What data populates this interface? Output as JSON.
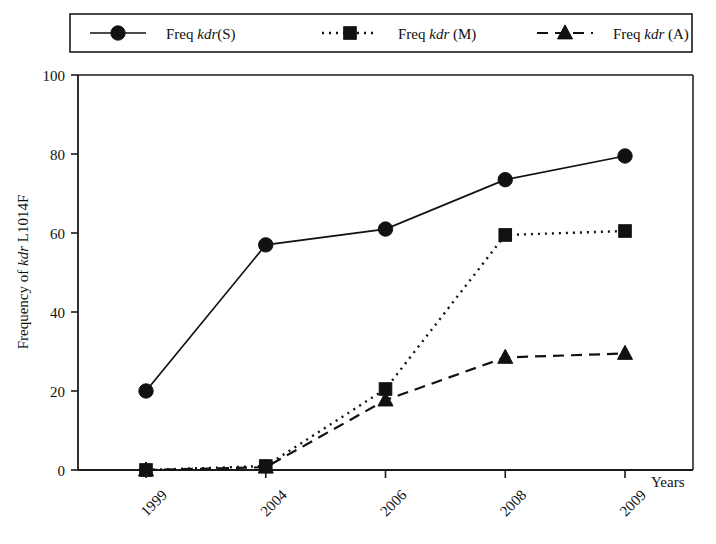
{
  "chart_data": {
    "type": "line",
    "title": "",
    "subtitle": "",
    "xlabel": "Years",
    "ylabel": "Frequency of kdr L1014F",
    "categories": [
      "1999",
      "2004",
      "2006",
      "2008",
      "2009"
    ],
    "x": [
      "1999",
      "2004",
      "2006",
      "2008",
      "2009"
    ],
    "xtick_labels": [
      "1999",
      "2004",
      "2006",
      "2008",
      "2009"
    ],
    "ytick_labels": [
      "0",
      "20",
      "40",
      "60",
      "80",
      "100"
    ],
    "yticks": [
      0,
      20,
      40,
      60,
      80,
      100
    ],
    "ylim": [
      0,
      100
    ],
    "grid": false,
    "legend_position": "top-outside",
    "annotations": [],
    "series": [
      {
        "name": "Freq kdr(S)",
        "name_prefix": "Freq ",
        "name_italic": "kdr",
        "name_suffix": "(S)",
        "marker": "circle",
        "linestyle": "solid",
        "color": "#111111",
        "values": [
          20,
          57,
          61,
          73.5,
          79.5
        ]
      },
      {
        "name": "Freq kdr (M)",
        "name_prefix": "Freq ",
        "name_italic": "kdr",
        "name_suffix": " (M)",
        "marker": "square",
        "linestyle": "dotted",
        "color": "#111111",
        "values": [
          0,
          1,
          20.5,
          59.5,
          60.5
        ]
      },
      {
        "name": "Freq kdr (A)",
        "name_prefix": "Freq ",
        "name_italic": "kdr",
        "name_suffix": " (A)",
        "marker": "triangle",
        "linestyle": "dashed",
        "color": "#111111",
        "values": [
          0,
          0.7,
          17.7,
          28.5,
          29.5
        ]
      }
    ]
  },
  "legend": {
    "entries": [
      {
        "label_prefix": "Freq ",
        "label_italic": "kdr",
        "label_suffix": "(S)",
        "marker": "circle",
        "linestyle": "solid"
      },
      {
        "label_prefix": "Freq ",
        "label_italic": "kdr",
        "label_suffix": " (M)",
        "marker": "square",
        "linestyle": "dotted"
      },
      {
        "label_prefix": "Freq ",
        "label_italic": "kdr",
        "label_suffix": " (A)",
        "marker": "triangle",
        "linestyle": "dashed"
      }
    ]
  },
  "axes": {
    "y_title": "Frequency of kdr L1014F",
    "x_title": "Years"
  },
  "colors": {
    "ink": "#111111",
    "background": "#ffffff"
  }
}
